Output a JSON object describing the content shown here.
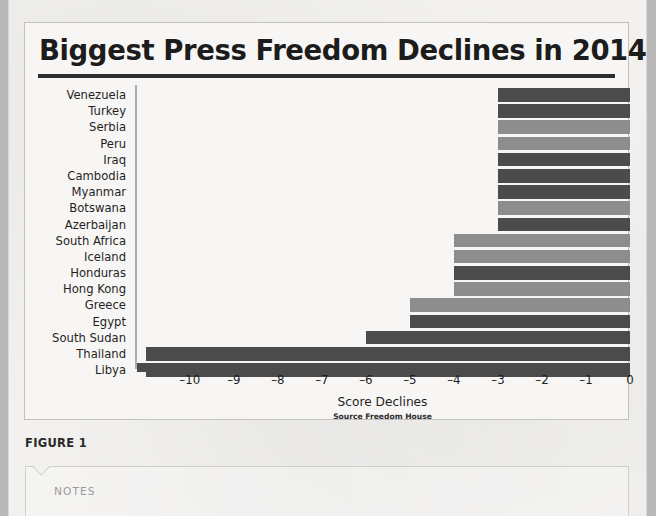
{
  "page": {
    "figure_caption": "FIGURE 1"
  },
  "notes": {
    "label": "NOTES"
  },
  "chart_data": {
    "type": "bar",
    "orientation": "horizontal",
    "title": "Biggest Press Freedom Declines in 2014",
    "xlabel": "Score Declines",
    "ylabel": "",
    "source": "Source Freedom House",
    "xlim": [
      -11.2,
      0
    ],
    "xticks": [
      -10,
      -9,
      -8,
      -7,
      -6,
      -5,
      -4,
      -3,
      -2,
      -1,
      0
    ],
    "xticklabels": [
      "–10",
      "–9",
      "–8",
      "–7",
      "–6",
      "–5",
      "–4",
      "–3",
      "–2",
      "–1",
      "0"
    ],
    "grid": false,
    "legend": false,
    "colors": {
      "dark": "#4b4b4b",
      "light": "#8d8d8d",
      "axis": "#4b4b4b",
      "title_rule": "#2e2e2e"
    },
    "categories": [
      "Venezuela",
      "Turkey",
      "Serbia",
      "Peru",
      "Iraq",
      "Cambodia",
      "Myanmar",
      "Botswana",
      "Azerbaijan",
      "South Africa",
      "Iceland",
      "Honduras",
      "Hong Kong",
      "Greece",
      "Egypt",
      "South Sudan",
      "Thailand",
      "Libya"
    ],
    "values": [
      -3,
      -3,
      -3,
      -3,
      -3,
      -3,
      -3,
      -3,
      -3,
      -4,
      -4,
      -4,
      -4,
      -5,
      -5,
      -6,
      -11,
      -11
    ],
    "bar_shades": [
      "dark",
      "dark",
      "light",
      "light",
      "dark",
      "dark",
      "dark",
      "light",
      "dark",
      "light",
      "light",
      "dark",
      "light",
      "light",
      "dark",
      "dark",
      "dark",
      "dark"
    ]
  }
}
